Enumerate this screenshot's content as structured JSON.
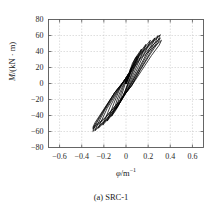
{
  "figure": {
    "caption": "(a) SRC-1",
    "top_artifact_text": "",
    "frame_color": "#555555",
    "grid_color": "#b9b9b9",
    "curve_color": "#000000",
    "background": "#ffffff"
  },
  "chart_data": {
    "type": "line",
    "title": "",
    "subtitle": "",
    "xlabel": "φ/m⁻¹",
    "ylabel": "M/(kN · m)",
    "xlim": [
      -0.7,
      0.7
    ],
    "ylim": [
      -80,
      80
    ],
    "xticks": [
      -0.6,
      -0.4,
      -0.2,
      0,
      0.2,
      0.4,
      0.6
    ],
    "xtick_labels": [
      "−0.6",
      "−0.4",
      "−0.2",
      "0",
      "0.2",
      "0.4",
      "0.6"
    ],
    "yticks": [
      -80,
      -60,
      -40,
      -20,
      0,
      20,
      40,
      60,
      80
    ],
    "ytick_labels": [
      "−80",
      "−60",
      "−40",
      "−20",
      "0",
      "20",
      "40",
      "60",
      "80"
    ],
    "grid": true,
    "grid_style": "dashed",
    "legend": null,
    "legend_position": "none",
    "annotations": [],
    "series": [
      {
        "name": "cycle-1",
        "peak_positive": {
          "x": 0.06,
          "y": 22
        },
        "peak_negative": {
          "x": -0.05,
          "y": -20
        },
        "points": [
          [
            0.0,
            0.0
          ],
          [
            0.02,
            10
          ],
          [
            0.04,
            18
          ],
          [
            0.06,
            22
          ],
          [
            0.05,
            17
          ],
          [
            0.03,
            8
          ],
          [
            0.01,
            -2
          ],
          [
            -0.01,
            -10
          ],
          [
            -0.03,
            -16
          ],
          [
            -0.05,
            -20
          ],
          [
            -0.04,
            -15
          ],
          [
            -0.02,
            -6
          ],
          [
            0.0,
            3
          ],
          [
            0.01,
            1
          ],
          [
            0.0,
            0.0
          ]
        ]
      },
      {
        "name": "cycle-2",
        "peak_positive": {
          "x": 0.1,
          "y": 34
        },
        "peak_negative": {
          "x": -0.09,
          "y": -32
        },
        "points": [
          [
            0.0,
            0.0
          ],
          [
            0.03,
            14
          ],
          [
            0.06,
            26
          ],
          [
            0.1,
            34
          ],
          [
            0.09,
            28
          ],
          [
            0.06,
            16
          ],
          [
            0.03,
            4
          ],
          [
            0.0,
            -8
          ],
          [
            -0.04,
            -20
          ],
          [
            -0.07,
            -28
          ],
          [
            -0.09,
            -32
          ],
          [
            -0.08,
            -26
          ],
          [
            -0.05,
            -14
          ],
          [
            -0.02,
            -2
          ],
          [
            0.01,
            6
          ],
          [
            0.0,
            2
          ],
          [
            0.0,
            0.0
          ]
        ]
      },
      {
        "name": "cycle-3",
        "peak_positive": {
          "x": 0.14,
          "y": 43
        },
        "peak_negative": {
          "x": -0.13,
          "y": -41
        },
        "points": [
          [
            0.0,
            0.0
          ],
          [
            0.04,
            16
          ],
          [
            0.08,
            31
          ],
          [
            0.14,
            43
          ],
          [
            0.12,
            36
          ],
          [
            0.09,
            24
          ],
          [
            0.05,
            10
          ],
          [
            0.01,
            -4
          ],
          [
            -0.04,
            -20
          ],
          [
            -0.09,
            -33
          ],
          [
            -0.13,
            -41
          ],
          [
            -0.11,
            -34
          ],
          [
            -0.08,
            -20
          ],
          [
            -0.04,
            -6
          ],
          [
            0.0,
            6
          ],
          [
            0.02,
            10
          ],
          [
            0.0,
            3
          ],
          [
            0.0,
            0.0
          ]
        ]
      },
      {
        "name": "cycle-4",
        "peak_positive": {
          "x": 0.18,
          "y": 49
        },
        "peak_negative": {
          "x": -0.17,
          "y": -47
        },
        "points": [
          [
            0.0,
            0.0
          ],
          [
            0.04,
            16
          ],
          [
            0.09,
            32
          ],
          [
            0.18,
            49
          ],
          [
            0.16,
            42
          ],
          [
            0.12,
            29
          ],
          [
            0.07,
            13
          ],
          [
            0.02,
            -4
          ],
          [
            -0.04,
            -20
          ],
          [
            -0.11,
            -36
          ],
          [
            -0.17,
            -47
          ],
          [
            -0.15,
            -40
          ],
          [
            -0.11,
            -25
          ],
          [
            -0.06,
            -8
          ],
          [
            -0.01,
            5
          ],
          [
            0.02,
            11
          ],
          [
            0.0,
            3
          ],
          [
            0.0,
            0.0
          ]
        ]
      },
      {
        "name": "cycle-5",
        "peak_positive": {
          "x": 0.22,
          "y": 54
        },
        "peak_negative": {
          "x": -0.21,
          "y": -52
        },
        "points": [
          [
            0.0,
            0.0
          ],
          [
            0.04,
            16
          ],
          [
            0.1,
            33
          ],
          [
            0.22,
            54
          ],
          [
            0.2,
            47
          ],
          [
            0.15,
            33
          ],
          [
            0.09,
            15
          ],
          [
            0.03,
            -3
          ],
          [
            -0.04,
            -21
          ],
          [
            -0.13,
            -39
          ],
          [
            -0.21,
            -52
          ],
          [
            -0.19,
            -45
          ],
          [
            -0.14,
            -28
          ],
          [
            -0.07,
            -9
          ],
          [
            -0.01,
            5
          ],
          [
            0.02,
            12
          ],
          [
            0.0,
            3
          ],
          [
            0.0,
            0.0
          ]
        ]
      },
      {
        "name": "cycle-6",
        "peak_positive": {
          "x": 0.26,
          "y": 57
        },
        "peak_negative": {
          "x": -0.25,
          "y": -56
        },
        "points": [
          [
            0.0,
            0.0
          ],
          [
            0.04,
            16
          ],
          [
            0.11,
            34
          ],
          [
            0.26,
            57
          ],
          [
            0.24,
            50
          ],
          [
            0.18,
            36
          ],
          [
            0.11,
            17
          ],
          [
            0.04,
            -2
          ],
          [
            -0.04,
            -21
          ],
          [
            -0.15,
            -42
          ],
          [
            -0.25,
            -56
          ],
          [
            -0.23,
            -49
          ],
          [
            -0.17,
            -31
          ],
          [
            -0.08,
            -10
          ],
          [
            -0.01,
            5
          ],
          [
            0.03,
            13
          ],
          [
            0.0,
            3
          ],
          [
            0.0,
            0.0
          ]
        ]
      },
      {
        "name": "cycle-7",
        "peak_positive": {
          "x": 0.29,
          "y": 60
        },
        "peak_negative": {
          "x": -0.28,
          "y": -59
        },
        "points": [
          [
            0.0,
            0.0
          ],
          [
            0.04,
            16
          ],
          [
            0.12,
            35
          ],
          [
            0.29,
            60
          ],
          [
            0.27,
            53
          ],
          [
            0.2,
            38
          ],
          [
            0.12,
            18
          ],
          [
            0.04,
            -2
          ],
          [
            -0.05,
            -22
          ],
          [
            -0.17,
            -44
          ],
          [
            -0.28,
            -59
          ],
          [
            -0.26,
            -52
          ],
          [
            -0.19,
            -33
          ],
          [
            -0.09,
            -11
          ],
          [
            -0.01,
            5
          ],
          [
            0.03,
            13
          ],
          [
            0.0,
            3
          ],
          [
            0.0,
            0.0
          ]
        ]
      },
      {
        "name": "cycle-8",
        "peak_positive": {
          "x": 0.31,
          "y": 61
        },
        "peak_negative": {
          "x": -0.3,
          "y": -60
        },
        "points": [
          [
            0.0,
            0.0
          ],
          [
            0.04,
            15
          ],
          [
            0.12,
            34
          ],
          [
            0.31,
            61
          ],
          [
            0.29,
            54
          ],
          [
            0.22,
            39
          ],
          [
            0.13,
            18
          ],
          [
            0.05,
            -2
          ],
          [
            -0.05,
            -22
          ],
          [
            -0.18,
            -45
          ],
          [
            -0.3,
            -60
          ],
          [
            -0.28,
            -53
          ],
          [
            -0.2,
            -34
          ],
          [
            -0.1,
            -11
          ],
          [
            -0.01,
            5
          ],
          [
            0.03,
            13
          ],
          [
            0.0,
            3
          ],
          [
            0.0,
            0.0
          ]
        ]
      },
      {
        "name": "cycle-9",
        "peak_positive": {
          "x": 0.31,
          "y": 57
        },
        "peak_negative": {
          "x": -0.3,
          "y": -57
        },
        "points": [
          [
            0.0,
            0.0
          ],
          [
            0.04,
            14
          ],
          [
            0.13,
            33
          ],
          [
            0.31,
            57
          ],
          [
            0.29,
            51
          ],
          [
            0.22,
            37
          ],
          [
            0.13,
            17
          ],
          [
            0.05,
            -3
          ],
          [
            -0.06,
            -22
          ],
          [
            -0.19,
            -44
          ],
          [
            -0.3,
            -57
          ],
          [
            -0.28,
            -51
          ],
          [
            -0.2,
            -33
          ],
          [
            -0.1,
            -11
          ],
          [
            -0.01,
            4
          ],
          [
            0.03,
            12
          ],
          [
            0.0,
            3
          ],
          [
            0.0,
            0.0
          ]
        ]
      },
      {
        "name": "cycle-10",
        "peak_positive": {
          "x": 0.32,
          "y": 54
        },
        "peak_negative": {
          "x": -0.3,
          "y": -55
        },
        "points": [
          [
            0.0,
            0.0
          ],
          [
            0.04,
            13
          ],
          [
            0.13,
            31
          ],
          [
            0.32,
            54
          ],
          [
            0.3,
            48
          ],
          [
            0.23,
            35
          ],
          [
            0.14,
            16
          ],
          [
            0.05,
            -3
          ],
          [
            -0.06,
            -22
          ],
          [
            -0.19,
            -43
          ],
          [
            -0.3,
            -55
          ],
          [
            -0.28,
            -49
          ],
          [
            -0.2,
            -32
          ],
          [
            -0.1,
            -11
          ],
          [
            -0.01,
            4
          ],
          [
            0.03,
            12
          ],
          [
            0.0,
            2
          ],
          [
            0.0,
            0.0
          ]
        ]
      }
    ]
  }
}
